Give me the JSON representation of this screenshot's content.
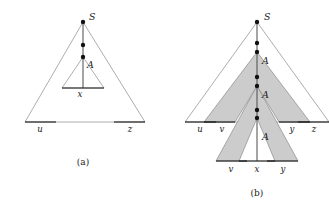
{
  "figure": {
    "top_cut_text": "",
    "panels": [
      {
        "id": "a",
        "caption": "(a)",
        "root_label": "S",
        "variable_labels": [
          "A"
        ],
        "leaf_labels": [
          "u",
          "x",
          "z"
        ],
        "node_count": 3,
        "shaded": false,
        "description": "Parse tree for string uxz with repeated variable A on the path from S"
      },
      {
        "id": "b",
        "caption": "(b)",
        "root_label": "S",
        "variable_labels": [
          "A",
          "A",
          "A"
        ],
        "leaf_labels_upper": [
          "u",
          "v",
          "y",
          "z"
        ],
        "leaf_labels_lower": [
          "v",
          "x",
          "y"
        ],
        "node_count": 7,
        "shaded": true,
        "description": "Pumped parse tree for string uvvxyyz with the A subtree duplicated"
      }
    ],
    "colors": {
      "shade_fill": "#cccccc",
      "outline_stroke": "#8a8a8a",
      "spine_stroke": "#4a4a4a",
      "node_fill": "#111111",
      "text": "#1a1a1a",
      "background": "#ffffff"
    }
  },
  "panel_a": {
    "root": "S",
    "A": "A",
    "u": "u",
    "x": "x",
    "z": "z",
    "caption": "(a)"
  },
  "panel_b": {
    "root": "S",
    "A1": "A",
    "A2": "A",
    "A3": "A",
    "u": "u",
    "v_upper": "v",
    "y_upper": "y",
    "z": "z",
    "v_lower": "v",
    "x": "x",
    "y_lower": "y",
    "caption": "(b)"
  }
}
